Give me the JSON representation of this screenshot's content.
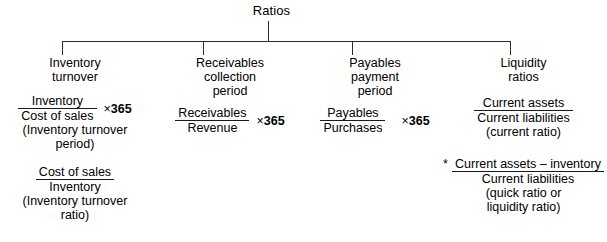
{
  "diagram": {
    "root_label": "Ratios",
    "branches": [
      {
        "id": "inventory-turnover",
        "heading": [
          "Inventory",
          "turnover"
        ],
        "formulas": [
          {
            "numerator": "Inventory",
            "denominator": "Cost of sales",
            "multiplier": "× 365",
            "times_symbol": "×",
            "multiplier_value": "365",
            "caption_lines": [
              "(Inventory turnover",
              "period)"
            ]
          },
          {
            "numerator": "Cost of sales",
            "denominator": "Inventory",
            "multiplier": "",
            "caption_lines": [
              "(Inventory turnover",
              "ratio)"
            ]
          }
        ]
      },
      {
        "id": "receivables-collection-period",
        "heading": [
          "Receivables",
          "collection",
          "period"
        ],
        "formulas": [
          {
            "numerator": "Receivables",
            "denominator": "Revenue",
            "times_symbol": "×",
            "multiplier_value": "365",
            "caption_lines": []
          }
        ]
      },
      {
        "id": "payables-payment-period",
        "heading": [
          "Payables",
          "payment",
          "period"
        ],
        "formulas": [
          {
            "numerator": "Payables",
            "denominator": "Purchases",
            "times_symbol": "×",
            "multiplier_value": "365",
            "caption_lines": []
          }
        ]
      },
      {
        "id": "liquidity-ratios",
        "heading": [
          "Liquidity",
          "ratios"
        ],
        "formulas": [
          {
            "numerator": "Current assets",
            "denominator": "Current liabilities",
            "caption_lines": [
              "(current ratio)"
            ]
          },
          {
            "star": "*",
            "numerator": "Current assets – inventory",
            "denominator": "Current liabilities",
            "caption_lines": [
              "(quick ratio or",
              "liquidity ratio)"
            ]
          }
        ]
      }
    ],
    "colors": {
      "line": "#2b2b2b",
      "text": "#000000",
      "background": "#ffffff"
    }
  }
}
